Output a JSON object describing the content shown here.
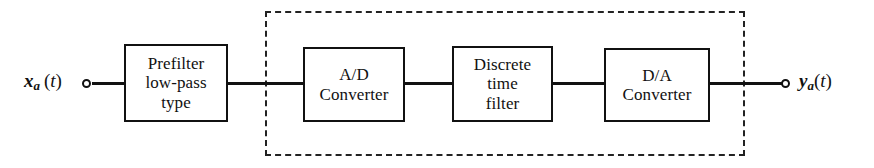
{
  "diagram": {
    "background_color": "#ffffff",
    "line_color": "#111111",
    "dash_color": "#222222"
  },
  "signals": {
    "input": {
      "var": "x",
      "subscript": "a",
      "open_paren": "(",
      "arg": "t",
      "close_paren": ")",
      "full": "xa (t)"
    },
    "output": {
      "var": "y",
      "subscript": "a",
      "open_paren": "(",
      "arg": "t",
      "close_paren": ")",
      "full": "ya(t)"
    }
  },
  "blocks": [
    {
      "id": "prefilter",
      "lines": [
        "Prefilter",
        "low-pass",
        "type"
      ],
      "inside_boundary": false
    },
    {
      "id": "adc",
      "lines": [
        "A/D",
        "Converter"
      ],
      "inside_boundary": true
    },
    {
      "id": "dfilter",
      "lines": [
        "Discrete",
        "time",
        "filter"
      ],
      "inside_boundary": true
    },
    {
      "id": "dac",
      "lines": [
        "D/A",
        "Converter"
      ],
      "inside_boundary": true
    }
  ],
  "boundary": {
    "style": "dashed",
    "label": ""
  }
}
